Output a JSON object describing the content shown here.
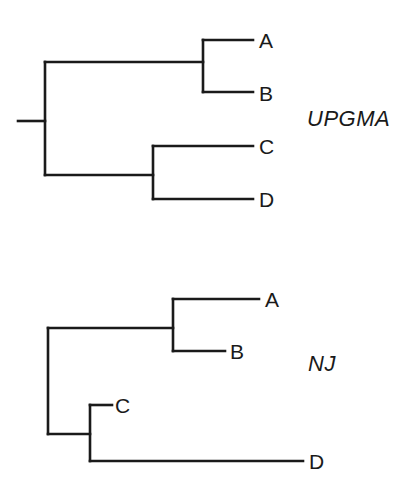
{
  "figure": {
    "background_color": "#ffffff",
    "line_color": "#1a1a1a",
    "line_width": 2.6,
    "text_color": "#1a1a1a",
    "width": 400,
    "height": 493
  },
  "trees": [
    {
      "id": "upgma",
      "method_label": "UPGMA",
      "method_label_pos": {
        "x": 307,
        "y": 108
      },
      "root_stub": {
        "x1": 18,
        "y1": 121,
        "x2": 45,
        "y2": 121
      },
      "root_vertical": {
        "x": 45,
        "y_top": 62,
        "y_bottom": 175
      },
      "branches": [
        {
          "name": "root-to-ab",
          "x1": 45,
          "y1": 62,
          "x2": 203,
          "y2": 62
        },
        {
          "name": "ab-vertical",
          "x1": 203,
          "y1": 40,
          "x2": 203,
          "y2": 92
        },
        {
          "name": "tip-a",
          "x1": 203,
          "y1": 40,
          "x2": 253,
          "y2": 40
        },
        {
          "name": "tip-b",
          "x1": 203,
          "y1": 92,
          "x2": 253,
          "y2": 92
        },
        {
          "name": "root-to-cd",
          "x1": 45,
          "y1": 175,
          "x2": 153,
          "y2": 175
        },
        {
          "name": "cd-vertical",
          "x1": 153,
          "y1": 146,
          "x2": 153,
          "y2": 199
        },
        {
          "name": "tip-c",
          "x1": 153,
          "y1": 146,
          "x2": 253,
          "y2": 146
        },
        {
          "name": "tip-d",
          "x1": 153,
          "y1": 199,
          "x2": 253,
          "y2": 199
        }
      ],
      "tips": [
        {
          "label": "A",
          "x": 259,
          "y": 30
        },
        {
          "label": "B",
          "x": 259,
          "y": 83
        },
        {
          "label": "C",
          "x": 259,
          "y": 136
        },
        {
          "label": "D",
          "x": 259,
          "y": 189
        }
      ]
    },
    {
      "id": "nj",
      "method_label": "NJ",
      "method_label_pos": {
        "x": 308,
        "y": 353
      },
      "root_stub": null,
      "root_vertical": {
        "x": 48,
        "y_top": 328,
        "y_bottom": 434
      },
      "branches": [
        {
          "name": "root-to-ab",
          "x1": 48,
          "y1": 328,
          "x2": 173,
          "y2": 328
        },
        {
          "name": "ab-vertical",
          "x1": 173,
          "y1": 299,
          "x2": 173,
          "y2": 351
        },
        {
          "name": "tip-a",
          "x1": 173,
          "y1": 299,
          "x2": 259,
          "y2": 299
        },
        {
          "name": "tip-b",
          "x1": 173,
          "y1": 351,
          "x2": 225,
          "y2": 351
        },
        {
          "name": "root-to-cd",
          "x1": 48,
          "y1": 434,
          "x2": 90,
          "y2": 434
        },
        {
          "name": "cd-vertical",
          "x1": 90,
          "y1": 405,
          "x2": 90,
          "y2": 461
        },
        {
          "name": "tip-c",
          "x1": 90,
          "y1": 405,
          "x2": 112,
          "y2": 405
        },
        {
          "name": "tip-d",
          "x1": 90,
          "y1": 461,
          "x2": 303,
          "y2": 461
        }
      ],
      "tips": [
        {
          "label": "A",
          "x": 265,
          "y": 289
        },
        {
          "label": "B",
          "x": 230,
          "y": 341
        },
        {
          "label": "C",
          "x": 115,
          "y": 395
        },
        {
          "label": "D",
          "x": 309,
          "y": 451
        }
      ]
    }
  ]
}
